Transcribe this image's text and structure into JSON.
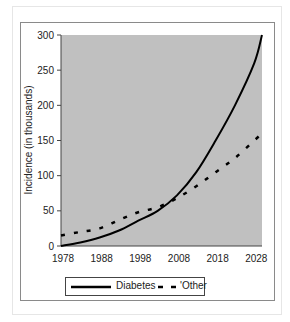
{
  "chart_data": {
    "type": "line",
    "title": "",
    "xlabel": "",
    "ylabel": "Incidence (in thousands)",
    "x": [
      1978,
      1983,
      1988,
      1993,
      1998,
      2003,
      2008,
      2013,
      2018,
      2023,
      2028,
      2030
    ],
    "x_ticks": [
      "1978",
      "1988",
      "1998",
      "2008",
      "2018",
      "2028"
    ],
    "y_ticks": [
      "0",
      "50",
      "100",
      "150",
      "200",
      "250",
      "300"
    ],
    "ylim": [
      0,
      300
    ],
    "xlim": [
      1978,
      2030
    ],
    "grid": false,
    "plot_background": "#c0c0c0",
    "legend_position": "bottom",
    "series": [
      {
        "name": "Diabetes",
        "style": "solid",
        "color": "#000000",
        "values": [
          0,
          5,
          12,
          22,
          36,
          50,
          72,
          105,
          150,
          200,
          260,
          300
        ]
      },
      {
        "name": "'Other",
        "style": "dashed",
        "color": "#000000",
        "values": [
          15,
          20,
          25,
          37,
          48,
          55,
          68,
          85,
          105,
          125,
          150,
          160
        ]
      }
    ]
  },
  "legend": {
    "diabetes_label": "Diabetes",
    "other_label": "'Other"
  },
  "axis": {
    "ylabel": "Incidence (in thousands)"
  }
}
